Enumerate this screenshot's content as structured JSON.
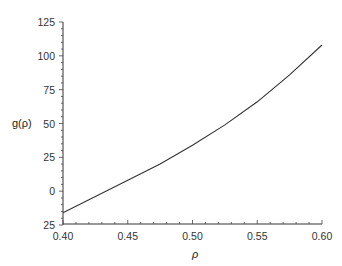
{
  "chart_data": {
    "type": "line",
    "title": "",
    "xlabel": "ρ",
    "ylabel": "g(ρ)",
    "xlim": [
      0.4,
      0.6
    ],
    "ylim": [
      -25,
      125
    ],
    "x_ticks": [
      "0.40",
      "0.45",
      "0.50",
      "0.55",
      "0.60"
    ],
    "y_ticks": [
      "125",
      "100",
      "75",
      "50",
      "25",
      "0",
      "25"
    ],
    "grid": false,
    "legend": null,
    "series": [
      {
        "name": "g(ρ)",
        "x": [
          0.4,
          0.425,
          0.45,
          0.475,
          0.5,
          0.525,
          0.55,
          0.575,
          0.6
        ],
        "values": [
          -16,
          -4,
          8,
          20,
          34,
          49,
          66,
          86,
          108
        ]
      }
    ]
  },
  "axes": {
    "xlabel": "ρ",
    "ylabel": "g(ρ)"
  }
}
